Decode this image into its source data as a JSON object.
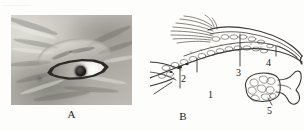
{
  "figure": {
    "header_scrap": "............",
    "panels": [
      {
        "id": "A",
        "caption": "A",
        "kind": "photograph",
        "subject": "close-up of an animal eye in wrinkled skin",
        "features": [
          "brow-ridge",
          "almond-eyelid-opening",
          "round-dark-pupil",
          "pale-iris",
          "specular-highlight",
          "skin-wrinkles"
        ]
      },
      {
        "id": "B",
        "caption": "B",
        "kind": "line-drawing",
        "subject": "longitudinal section of a tapering tubular organ with bristles, plus detached glandular inset",
        "features": [
          "bristle-tuft",
          "segmented-wall",
          "granular-lining",
          "tapering-duct",
          "pointed-tip",
          "lobular-gland",
          "flared-duct"
        ]
      }
    ],
    "labels": [
      {
        "number": "1",
        "panel": "B"
      },
      {
        "number": "2",
        "panel": "B"
      },
      {
        "number": "3",
        "panel": "B"
      },
      {
        "number": "4",
        "panel": "B"
      },
      {
        "number": "5",
        "panel": "B"
      }
    ],
    "colors": {
      "page_background": "#fdfdfb",
      "ink": "#1b1a18",
      "line_art": "#3a3733",
      "photo_light": "#dedcd6",
      "photo_dark": "#6e6c68",
      "pupil": "#1a1816"
    }
  }
}
